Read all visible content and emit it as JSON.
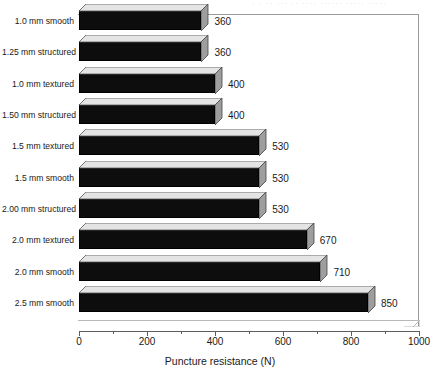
{
  "scan_header": "· · ·· ··· ·· ···· ······ ····· ·····",
  "chart_data": {
    "type": "bar",
    "orientation": "horizontal",
    "style": "3d",
    "title": "",
    "xlabel": "Puncture resistance (N)",
    "ylabel": "",
    "xlim": [
      0,
      1000
    ],
    "xticks": [
      0,
      200,
      400,
      600,
      800,
      1000
    ],
    "xtick_labels": [
      "0",
      "200",
      "400",
      "600",
      "800",
      "1000"
    ],
    "minor_tick_step": 100,
    "grid": false,
    "legend": false,
    "bar_color": "#0d0d0d",
    "bar_top_color": "#e4e4e4",
    "bar_side_color": "#9e9e9e",
    "categories": [
      "1.0 mm smooth",
      "1.25 mm structured",
      "1.0 mm textured",
      "1.50 mm structured",
      "1.5 mm textured",
      "1.5 mm smooth",
      "2.00 mm structured",
      "2.0 mm textured",
      "2.0 mm smooth",
      "2.5 mm smooth"
    ],
    "values": [
      360,
      360,
      400,
      400,
      530,
      530,
      530,
      670,
      710,
      850
    ],
    "value_labels": [
      "360",
      "360",
      "400",
      "400",
      "530",
      "530",
      "530",
      "670",
      "710",
      "850"
    ]
  }
}
